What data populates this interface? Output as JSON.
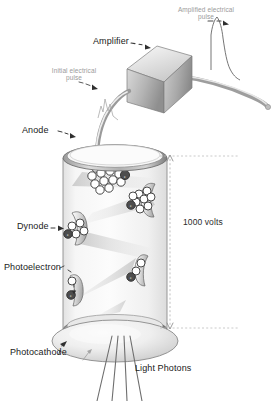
{
  "figure": {
    "background_color": "#ffffff",
    "width": 278,
    "height": 401
  },
  "labels": {
    "amplified_pulse": "Amplified electrical\npulse",
    "amplified_pulse_line1": "Amplified electrical",
    "amplified_pulse_line2": "pulse",
    "amplifier": "Amplifier",
    "initial_pulse_line1": "Initial electrical",
    "initial_pulse_line2": "pulse",
    "anode": "Anode",
    "dynode": "Dynode",
    "photoelectron": "Photoelectron",
    "photocathode": "Photocathode",
    "light_photons": "Light Photons",
    "voltage": "1000 volts"
  },
  "colors": {
    "label_dark": "#1a1a1a",
    "label_soft_gray": "#9a9a9a",
    "tube_glass": "#f2f2f2",
    "metal_dark": "#6e6e6e",
    "metal_light": "#d8d8d8",
    "outline": "#6b6b6b",
    "beam_gray": "#d9d9d9",
    "dotted_gray": "#b5b5b5"
  },
  "electron_markers": {
    "symbol": "e",
    "clusters": [
      {
        "name": "anode-cluster",
        "count": 14
      },
      {
        "name": "dynode-4-cluster",
        "count": 9
      },
      {
        "name": "dynode-3-cluster",
        "count": 5
      },
      {
        "name": "dynode-2-cluster",
        "count": 3
      },
      {
        "name": "dynode-1-cluster",
        "count": 2
      }
    ]
  },
  "components": {
    "dynode_count": 4,
    "photon_ray_count": 4
  }
}
